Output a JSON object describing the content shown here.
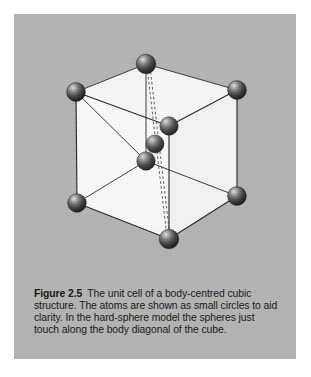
{
  "figure": {
    "label": "Figure 2.5",
    "caption_text": "The unit cell of a body-centred cubic structure. The atoms are shown as small circles to aid clarity. In the hard-sphere model the spheres just touch along the body diagonal of the cube.",
    "caption_lines": [
      "The unit cell of a body-centred cubic",
      "structure. The atoms are shown as small circles to aid",
      "clarity. In the hard-sphere model the spheres just",
      "touch along the body diagonal of the cube."
    ]
  },
  "colors": {
    "page_background": "#ffffff",
    "panel_background": "#b4b4b2",
    "cube_face": "#f7f7f5",
    "cube_edge": "#2b2b2b",
    "diagonal_dash": "#3a3a3a",
    "atom_dark": "#2a2a2a",
    "atom_mid": "#585858",
    "atom_highlight": "#d8d8d8",
    "caption_text": "#151515"
  },
  "diagram": {
    "type": "crystal-lattice-unit-cell",
    "lattice": "body-centred cubic (bcc)",
    "atom_count_corner": 8,
    "atom_count_body_centre": 1,
    "atom_radius_px": 9.5,
    "vertices": {
      "top_back_left": {
        "x": 62,
        "y": 78
      },
      "top_back_right": {
        "x": 132,
        "y": 50
      },
      "top_front_right": {
        "x": 223,
        "y": 76
      },
      "top_front_left": {
        "x": 155,
        "y": 112
      },
      "bottom_back_left": {
        "x": 63,
        "y": 189
      },
      "bottom_back_right": {
        "x": 132,
        "y": 147
      },
      "bottom_front_right": {
        "x": 223,
        "y": 182
      },
      "bottom_front_left": {
        "x": 155,
        "y": 225
      }
    },
    "body_centre": {
      "x": 140,
      "y": 130
    },
    "body_diagonal": {
      "from": "top_back_right",
      "to": "bottom_front_left",
      "style": "dashed",
      "passes_through": "body_centre"
    }
  }
}
